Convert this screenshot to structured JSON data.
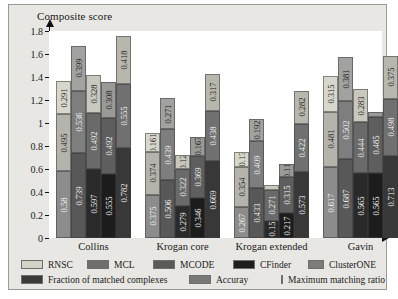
{
  "figure": {
    "y_axis_title": "Composite score",
    "y_ticks": [
      "0",
      "0.2",
      "0.4",
      "0.6",
      "0.8",
      "1",
      "1.2",
      "1.4",
      "1.6",
      "1.8"
    ]
  },
  "legend": {
    "methods": [
      {
        "label": "RNSC",
        "color": "#d4d3c8"
      },
      {
        "label": "MCL",
        "color": "#6e6e6e"
      },
      {
        "label": "MCODE",
        "color": "#5a5a5a"
      },
      {
        "label": "CFinder",
        "color": "#1e1e1e"
      },
      {
        "label": "ClusterONE",
        "color": "#7c7c7c"
      }
    ],
    "metrics": [
      {
        "label": "Fraction of matched complexes",
        "color": "#3a3a3a"
      },
      {
        "label": "Accuray",
        "color": "#787878"
      },
      {
        "label": "Maximum matching ratio",
        "color": "#cfcec3"
      }
    ]
  },
  "chart_data": {
    "type": "bar",
    "subtype": "stacked-grouped",
    "title": "",
    "xlabel": "",
    "ylabel": "Composite score",
    "ylim": [
      0,
      1.8
    ],
    "grid": false,
    "legend_position": "bottom",
    "categories": [
      "Collins",
      "Krogan core",
      "Krogan extended",
      "Gavin"
    ],
    "methods": [
      "RNSC",
      "MCL",
      "MCODE",
      "CFinder",
      "ClusterONE"
    ],
    "stack_components": [
      "Fraction of matched complexes",
      "Accuray",
      "Maximum matching ratio"
    ],
    "groups": [
      {
        "name": "Collins",
        "bars": [
          {
            "method": "RNSC",
            "fraction_of_matched_complexes": 0.58,
            "accuray": 0.495,
            "maximum_matching_ratio": 0.291,
            "total": 1.366
          },
          {
            "method": "MCL",
            "fraction_of_matched_complexes": 0.739,
            "accuray": 0.536,
            "maximum_matching_ratio": 0.399,
            "total": 1.674
          },
          {
            "method": "MCODE",
            "fraction_of_matched_complexes": 0.597,
            "accuray": 0.492,
            "maximum_matching_ratio": 0.328,
            "total": 1.417
          },
          {
            "method": "CFinder",
            "fraction_of_matched_complexes": 0.555,
            "accuray": 0.492,
            "maximum_matching_ratio": 0.308,
            "total": 1.355
          },
          {
            "method": "ClusterONE",
            "fraction_of_matched_complexes": 0.782,
            "accuray": 0.555,
            "maximum_matching_ratio": 0.418,
            "total": 1.755
          }
        ]
      },
      {
        "name": "Krogan core",
        "bars": [
          {
            "method": "RNSC",
            "fraction_of_matched_complexes": 0.375,
            "accuray": 0.374,
            "maximum_matching_ratio": 0.161,
            "total": 0.91
          },
          {
            "method": "MCL",
            "fraction_of_matched_complexes": 0.506,
            "accuray": 0.439,
            "maximum_matching_ratio": 0.271,
            "total": 1.216
          },
          {
            "method": "MCODE",
            "fraction_of_matched_complexes": 0.279,
            "accuray": 0.322,
            "maximum_matching_ratio": 0.12,
            "total": 0.721
          },
          {
            "method": "CFinder",
            "fraction_of_matched_complexes": 0.346,
            "accuray": 0.369,
            "maximum_matching_ratio": 0.167,
            "total": 0.882
          },
          {
            "method": "ClusterONE",
            "fraction_of_matched_complexes": 0.669,
            "accuray": 0.438,
            "maximum_matching_ratio": 0.317,
            "total": 1.424
          }
        ]
      },
      {
        "name": "Krogan extended",
        "bars": [
          {
            "method": "RNSC",
            "fraction_of_matched_complexes": 0.267,
            "accuray": 0.354,
            "maximum_matching_ratio": 0.13,
            "total": 0.751
          },
          {
            "method": "MCL",
            "fraction_of_matched_complexes": 0.433,
            "accuray": 0.409,
            "maximum_matching_ratio": 0.192,
            "total": 1.034
          },
          {
            "method": "MCODE",
            "fraction_of_matched_complexes": 0.15,
            "accuray": 0.271,
            "maximum_matching_ratio": 0.04,
            "total": 0.461
          },
          {
            "method": "CFinder",
            "fraction_of_matched_complexes": 0.217,
            "accuray": 0.315,
            "maximum_matching_ratio": 0.11,
            "total": 0.642
          },
          {
            "method": "ClusterONE",
            "fraction_of_matched_complexes": 0.573,
            "accuray": 0.422,
            "maximum_matching_ratio": 0.282,
            "total": 1.277
          }
        ]
      },
      {
        "name": "Gavin",
        "bars": [
          {
            "method": "RNSC",
            "fraction_of_matched_complexes": 0.617,
            "accuray": 0.481,
            "maximum_matching_ratio": 0.315,
            "total": 1.413
          },
          {
            "method": "MCL",
            "fraction_of_matched_complexes": 0.687,
            "accuray": 0.502,
            "maximum_matching_ratio": 0.381,
            "total": 1.57
          },
          {
            "method": "MCODE",
            "fraction_of_matched_complexes": 0.565,
            "accuray": 0.444,
            "maximum_matching_ratio": 0.283,
            "total": 1.292
          },
          {
            "method": "CFinder",
            "fraction_of_matched_complexes": 0.565,
            "accuray": 0.485,
            "maximum_matching_ratio": 0.05,
            "total": 1.1
          },
          {
            "method": "ClusterONE",
            "fraction_of_matched_complexes": 0.713,
            "accuray": 0.498,
            "maximum_matching_ratio": 0.375,
            "total": 1.586
          }
        ]
      }
    ],
    "bar_value_labels": {
      "Collins": {
        "RNSC": [
          "0.58",
          "0.495",
          "0.291"
        ],
        "MCL": [
          "0.739",
          "0.536",
          "0.399"
        ],
        "MCODE": [
          "0.597",
          "0.492",
          "0.328"
        ],
        "CFinder": [
          "0.555",
          "0.492",
          "0.308"
        ],
        "ClusterONE": [
          "0.782",
          "0.555",
          "0.418"
        ]
      },
      "Krogan core": {
        "RNSC": [
          "0.375",
          "0.374",
          "0.161"
        ],
        "MCL": [
          "0.506",
          "0.439",
          "0.271"
        ],
        "MCODE": [
          "0.279",
          "0.322",
          "0.12"
        ],
        "CFinder": [
          "0.346",
          "0.369",
          "0.167"
        ],
        "ClusterONE": [
          "0.669",
          "0.438",
          "0.317"
        ]
      },
      "Krogan extended": {
        "RNSC": [
          "0.267",
          "0.354",
          "0.13"
        ],
        "MCL": [
          "0.433",
          "0.409",
          "0.192"
        ],
        "MCODE": [
          "0.15",
          "0.271",
          ""
        ],
        "CFinder": [
          "0.217",
          "0.315",
          "0.11"
        ],
        "ClusterONE": [
          "0.573",
          "0.422",
          "0.282"
        ]
      },
      "Gavin": {
        "RNSC": [
          "0.617",
          "0.481",
          "0.315"
        ],
        "MCL": [
          "0.687",
          "0.502",
          "0.381"
        ],
        "MCODE": [
          "0.565",
          "0.444",
          "0.283"
        ],
        "CFinder": [
          "0.565",
          "0.485",
          ""
        ],
        "ClusterONE": [
          "0.713",
          "0.498",
          "0.375"
        ]
      }
    }
  }
}
